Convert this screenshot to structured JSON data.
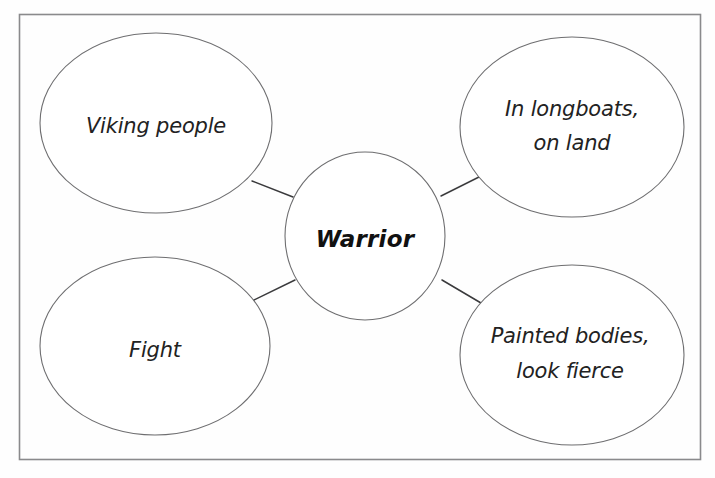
{
  "diagram": {
    "type": "mind-map",
    "frame": {
      "present": true,
      "border_color": "#8a8a8c",
      "background_color": "#fefefe"
    },
    "center_node": {
      "label": "Warrior",
      "bold": true,
      "shape": "ellipse"
    },
    "branch_nodes": [
      {
        "id": "top-left",
        "shape": "ellipse",
        "lines": [
          "Viking people"
        ],
        "line1": "Viking people",
        "line2": ""
      },
      {
        "id": "top-right",
        "shape": "ellipse",
        "lines": [
          "In longboats,",
          "on land"
        ],
        "line1": "In longboats,",
        "line2": "on land"
      },
      {
        "id": "bottom-left",
        "shape": "ellipse",
        "lines": [
          "Fight"
        ],
        "line1": "Fight",
        "line2": ""
      },
      {
        "id": "bottom-right",
        "shape": "ellipse",
        "lines": [
          "Painted bodies,",
          "look fierce"
        ],
        "line1": "Painted bodies,",
        "line2": "look fierce"
      }
    ],
    "connectors": [
      {
        "from": "center",
        "to": "top-left"
      },
      {
        "from": "center",
        "to": "top-right"
      },
      {
        "from": "center",
        "to": "bottom-left"
      },
      {
        "from": "center",
        "to": "bottom-right"
      }
    ],
    "colors": {
      "stroke": "#6e6e70",
      "connector": "#3a3a3c",
      "text": "#222222",
      "center_text": "#111111"
    }
  }
}
